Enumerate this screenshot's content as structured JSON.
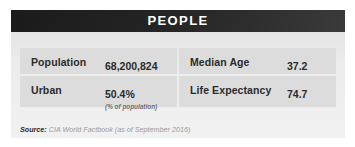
{
  "card": {
    "header": {
      "title": "PEOPLE"
    },
    "rows": [
      {
        "left": {
          "label": "Population",
          "value": "68,200,824",
          "subnote": ""
        },
        "right": {
          "label": "Median Age",
          "value": "37.2",
          "subnote": ""
        }
      },
      {
        "left": {
          "label": "Urban",
          "value": "50.4%",
          "subnote": "(% of population)"
        },
        "right": {
          "label": "Life Expectancy",
          "value": "74.7",
          "subnote": ""
        }
      }
    ],
    "footer": {
      "label": "Source:",
      "text": "CIA World Factbook (as of September 2016)"
    }
  },
  "colors": {
    "header_dark": "#1b1b1b",
    "header_light": "#3a3a3a",
    "body_bg": "#ececec",
    "row_bg": "#dcdcdc",
    "text_primary": "#2b2b2b",
    "text_muted": "#9a9a9a",
    "header_text": "#ffffff"
  }
}
